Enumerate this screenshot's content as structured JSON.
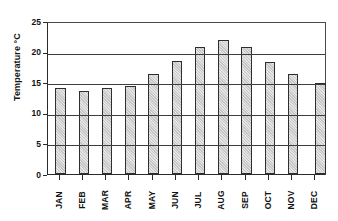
{
  "chart_data": {
    "type": "bar",
    "title": "",
    "xlabel": "",
    "ylabel": "Temperature °C",
    "categories": [
      "JAN",
      "FEB",
      "MAR",
      "APR",
      "MAY",
      "JUN",
      "JUL",
      "AUG",
      "SEP",
      "OCT",
      "NOV",
      "DEC"
    ],
    "values": [
      14.0,
      13.5,
      14.0,
      14.4,
      16.4,
      18.4,
      20.8,
      21.9,
      20.8,
      18.3,
      16.3,
      14.8
    ],
    "ylim": [
      0,
      25
    ],
    "y_ticks": [
      0,
      5,
      10,
      15,
      20,
      25
    ],
    "y_tick_labels": [
      "0",
      "5",
      "10",
      "15",
      "20",
      "25"
    ],
    "grid": true,
    "grid_axis": "y",
    "legend": false,
    "legend_position": "none",
    "bar_fill_color": "#c6c6c6",
    "bar_edge_color": "#2e2e2e",
    "axis_color": "#2b2b2b",
    "gridline_color": "#3d3d3d",
    "background_color": "#ffffff"
  }
}
